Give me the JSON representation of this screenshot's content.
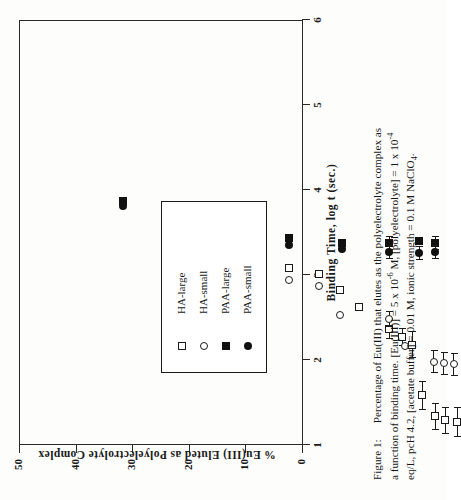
{
  "figure": {
    "label": "Figure 1:",
    "caption_line1": "Percentage of Eu(III) that elutes as the polyelectrolyte complex as",
    "caption_line2_a": "a function of binding time.  [Eu(III)] = 5 x 10",
    "caption_line2_sup": "-6",
    "caption_line2_b": " M, [polyelectrolyte] = 1 x 10",
    "caption_line2_sup2": "-4",
    "caption_line3_a": "eq/L, pcH 4.2, [acetate buffer] = 0.01 M, ionic strength = 0.1 M NaClO",
    "caption_line3_sub": "4",
    "caption_line3_b": "."
  },
  "chart_data": {
    "type": "scatter",
    "title": "",
    "xlabel": "Binding  Time,  log  t  (sec.)",
    "ylabel": "%  Eu(III)  Eluted  as  Polyelectrolyte  Complex",
    "xlim": [
      1,
      6
    ],
    "ylim": [
      0,
      50
    ],
    "xticks": [
      1,
      2,
      3,
      4,
      5,
      6
    ],
    "yticks": [
      0,
      10,
      20,
      30,
      40,
      50
    ],
    "grid": false,
    "legend_position": "inside-lower-left",
    "marker_styles": {
      "HA-large": "open-square",
      "HA-small": "open-circle",
      "PAA-large": "filled-square",
      "PAA-small": "filled-circle"
    },
    "series": [
      {
        "name": "HA-large",
        "marker": "open-square",
        "points": [
          {
            "x": 3.8,
            "y": 13.0,
            "xerr": 0
          },
          {
            "x": 4.15,
            "y": 14.2,
            "xerr": 0
          },
          {
            "x": 4.4,
            "y": 17.0,
            "xerr": 0
          },
          {
            "x": 4.62,
            "y": 20.0,
            "xerr": 0
          },
          {
            "x": 4.98,
            "y": 23.8,
            "xerr": 1.9
          },
          {
            "x": 5.13,
            "y": 25.3,
            "xerr": 1.6
          },
          {
            "x": 5.25,
            "y": 26.6,
            "xerr": 2.4
          },
          {
            "x": 5.37,
            "y": 35.6,
            "xerr": 2.6
          },
          {
            "x": 5.52,
            "y": 39.3,
            "xerr": 2.4
          },
          {
            "x": 5.64,
            "y": 40.0,
            "xerr": 2.4
          },
          {
            "x": 5.78,
            "y": 40.3,
            "xerr": 2.6
          }
        ]
      },
      {
        "name": "HA-small",
        "marker": "open-circle",
        "points": [
          {
            "x": 3.8,
            "y": 15.2,
            "xerr": 0
          },
          {
            "x": 4.15,
            "y": 16.3,
            "xerr": 0
          },
          {
            "x": 4.4,
            "y": 21.3,
            "xerr": 0
          },
          {
            "x": 4.98,
            "y": 22.1,
            "xerr": 1.4
          },
          {
            "x": 5.16,
            "y": 26.9,
            "xerr": 0
          },
          {
            "x": 5.5,
            "y": 29.6,
            "xerr": 2.0
          },
          {
            "x": 5.62,
            "y": 29.9,
            "xerr": 2.0
          },
          {
            "x": 5.74,
            "y": 30.1,
            "xerr": 2.0
          }
        ]
      },
      {
        "name": "PAA-large",
        "marker": "filled-square",
        "points": [
          {
            "x": 1.85,
            "y": 1.2,
            "xerr": 0
          },
          {
            "x": 3.8,
            "y": 7.8,
            "xerr": 0
          },
          {
            "x": 4.42,
            "y": 8.6,
            "xerr": 0
          },
          {
            "x": 4.98,
            "y": 8.7,
            "xerr": 1.2
          },
          {
            "x": 5.33,
            "y": 8.3,
            "xerr": 0
          },
          {
            "x": 5.52,
            "y": 8.7,
            "xerr": 1.2
          }
        ]
      },
      {
        "name": "PAA-small",
        "marker": "filled-circle",
        "points": [
          {
            "x": 1.85,
            "y": 2.1,
            "xerr": 0
          },
          {
            "x": 3.8,
            "y": 9.0,
            "xerr": 0
          },
          {
            "x": 4.42,
            "y": 9.8,
            "xerr": 0
          },
          {
            "x": 4.98,
            "y": 10.2,
            "xerr": 1.2
          },
          {
            "x": 5.33,
            "y": 10.4,
            "xerr": 1.2
          },
          {
            "x": 5.52,
            "y": 10.2,
            "xerr": 1.2
          }
        ]
      }
    ]
  },
  "legend": {
    "entries": [
      {
        "label": "HA-large",
        "marker": "open-square"
      },
      {
        "label": "HA-small",
        "marker": "open-circle"
      },
      {
        "label": "PAA-large",
        "marker": "filled-square"
      },
      {
        "label": "PAA-small",
        "marker": "filled-circle"
      }
    ]
  }
}
